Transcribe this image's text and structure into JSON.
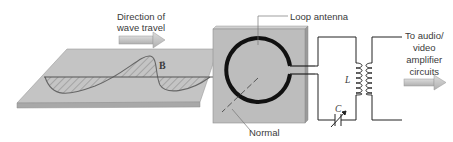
{
  "diagram": {
    "labels": {
      "direction": [
        "Direction of",
        "wave travel"
      ],
      "field_vector": "B",
      "loop_antenna": "Loop antenna",
      "normal": "Normal",
      "inductor": "L",
      "capacitor": "C",
      "output": [
        "To audio/",
        "video",
        "amplifier",
        "circuits"
      ]
    },
    "colors": {
      "panel": "#bdbdbd",
      "panel_edge": "#8f8f8f",
      "arrow": "#c8c8c8",
      "loop": "#111111",
      "wire": "#333333"
    }
  }
}
